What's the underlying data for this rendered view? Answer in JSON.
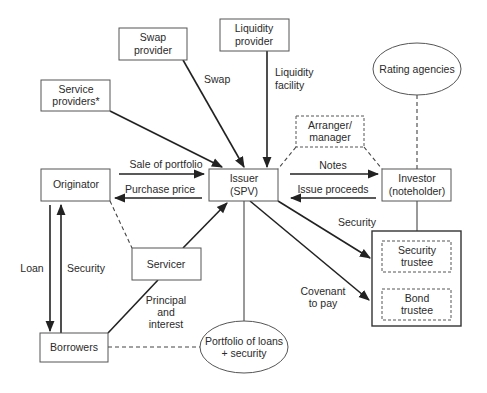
{
  "diagram": {
    "nodes": {
      "swap_provider": {
        "line1": "Swap",
        "line2": "provider"
      },
      "liquidity_provider": {
        "line1": "Liquidity",
        "line2": "provider"
      },
      "service_providers": {
        "line1": "Service",
        "line2": "providers*"
      },
      "rating_agencies": {
        "line1": "Rating agencies"
      },
      "arranger": {
        "line1": "Arranger/",
        "line2": "manager"
      },
      "originator": {
        "line1": "Originator"
      },
      "issuer": {
        "line1": "Issuer",
        "line2": "(SPV)"
      },
      "investor": {
        "line1": "Investor",
        "line2": "(noteholder)"
      },
      "servicer": {
        "line1": "Servicer"
      },
      "security_trustee": {
        "line1": "Security",
        "line2": "trustee"
      },
      "bond_trustee": {
        "line1": "Bond",
        "line2": "trustee"
      },
      "borrowers": {
        "line1": "Borrowers"
      },
      "portfolio": {
        "line1": "Portfolio of loans",
        "line2": "+ security"
      }
    },
    "edges": {
      "swap": "Swap",
      "liquidity_facility": {
        "line1": "Liquidity",
        "line2": "facility"
      },
      "sale_of_portfolio": "Sale of portfolio",
      "purchase_price": "Purchase price",
      "notes": "Notes",
      "issue_proceeds": "Issue proceeds",
      "security_to_trustee": "Security",
      "covenant_to_pay": {
        "line1": "Covenant",
        "line2": "to pay"
      },
      "loan": "Loan",
      "security_borrower": "Security",
      "principal_interest": {
        "line1": "Principal",
        "line2": "and",
        "line3": "interest"
      }
    }
  }
}
